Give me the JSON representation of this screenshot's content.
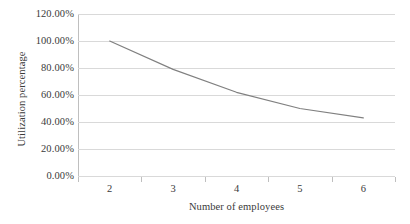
{
  "chart_data": {
    "type": "line",
    "title": "",
    "subtitle": "",
    "xlabel": "Number of employees",
    "ylabel": "Utilization percentage",
    "categories": [
      "2",
      "3",
      "4",
      "5",
      "6"
    ],
    "x_tick_labels": [
      "2",
      "3",
      "4",
      "5",
      "6"
    ],
    "y_tick_labels": [
      "0.00%",
      "20.00%",
      "40.00%",
      "60.00%",
      "80.00%",
      "100.00%",
      "120.00%"
    ],
    "y_tick_values": [
      0,
      20,
      40,
      60,
      80,
      100,
      120
    ],
    "ylim": [
      0,
      120
    ],
    "values": [
      100.0,
      79.0,
      62.0,
      50.0,
      43.0
    ],
    "value_labels": [
      "100.00%",
      "79.00%",
      "62.00%",
      "50.00%",
      "43.00%"
    ],
    "series": [
      {
        "name": "Utilization percentage",
        "values": [
          100.0,
          79.0,
          62.0,
          50.0,
          43.0
        ],
        "color": "#808080",
        "marker": "none",
        "line_width": 1.2
      }
    ],
    "grid": {
      "horizontal": true,
      "vertical": false,
      "color": "#d9d9d9"
    },
    "legend": {
      "visible": false,
      "position": "none"
    },
    "axes": {
      "y_axis_line_color": "#bfbfbf",
      "x_tick_marks": true,
      "x_axis_type": "category"
    },
    "background_color": "#ffffff",
    "text_color": "#3a3a3a",
    "annotations": []
  }
}
